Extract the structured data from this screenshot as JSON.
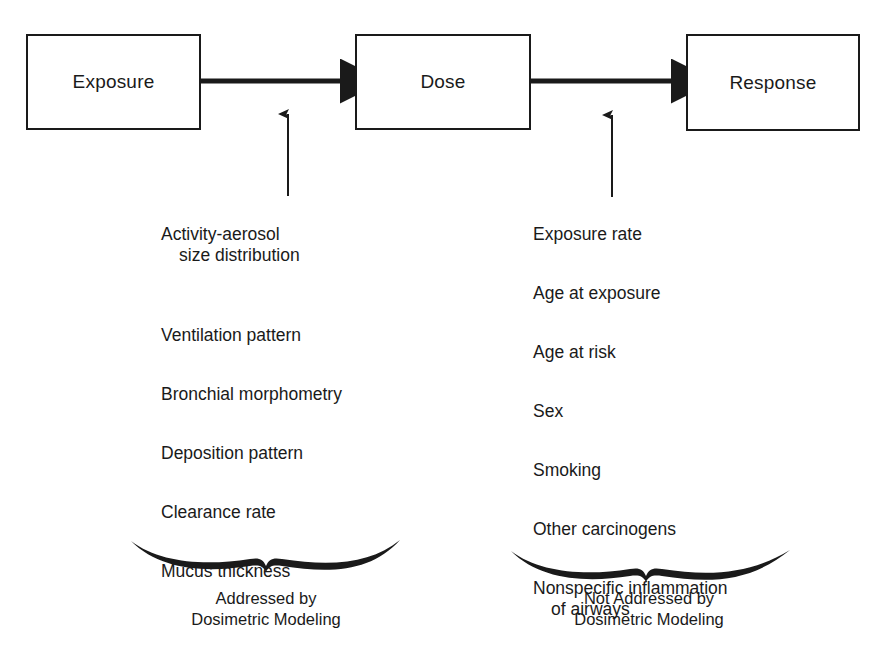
{
  "diagram": {
    "ink_color": "#1a1a1a",
    "background_color": "#ffffff"
  },
  "nodes": [
    {
      "id": "exposure",
      "label": "Exposure"
    },
    {
      "id": "dose",
      "label": "Dose"
    },
    {
      "id": "response",
      "label": "Response"
    }
  ],
  "arrows": {
    "exposure_to_dose": "horizontal-arrow-right",
    "dose_to_response": "horizontal-arrow-right",
    "left_factors_to_arrow1": "vertical-arrow-up",
    "right_factors_to_arrow2": "vertical-arrow-up"
  },
  "left_column": {
    "items": [
      {
        "line1": "Activity-aerosol",
        "line2": "size distribution"
      },
      {
        "line1": "Ventilation pattern",
        "line2": ""
      },
      {
        "line1": "Bronchial morphometry",
        "line2": ""
      },
      {
        "line1": "Deposition pattern",
        "line2": ""
      },
      {
        "line1": "Clearance rate",
        "line2": ""
      },
      {
        "line1": "Mucus thickness",
        "line2": ""
      }
    ],
    "caption_line1": "Addressed by",
    "caption_line2": "Dosimetric Modeling"
  },
  "right_column": {
    "items": [
      {
        "line1": "Exposure rate",
        "line2": ""
      },
      {
        "line1": "Age at exposure",
        "line2": ""
      },
      {
        "line1": "Age at risk",
        "line2": ""
      },
      {
        "line1": "Sex",
        "line2": ""
      },
      {
        "line1": "Smoking",
        "line2": ""
      },
      {
        "line1": "Other carcinogens",
        "line2": ""
      },
      {
        "line1": "Nonspecific inflammation",
        "line2": "of airways"
      }
    ],
    "caption_line1": "Not Addressed by",
    "caption_line2": "Dosimetric Modeling"
  }
}
